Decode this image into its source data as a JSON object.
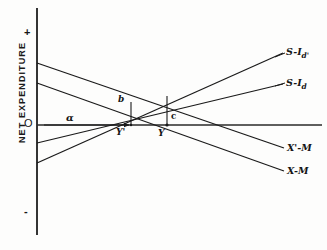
{
  "figure": {
    "axis_title": "NET EXPENDITURE",
    "origin_label": "O",
    "positive_sign": "+",
    "negative_sign": "-",
    "background_color": "#fdfdfc",
    "line_color": "#1a1a1a"
  },
  "curve_labels": {
    "s_i_d_prime": {
      "base": "S-I",
      "sub": "d'"
    },
    "s_i_d": {
      "base": "S-I",
      "sub": "d"
    },
    "x_prime_m": "X'-M",
    "x_m": "X-M"
  },
  "point_labels": {
    "alpha": "α",
    "b": "b",
    "c": "c",
    "y_prime": "Y'",
    "y": "Y"
  },
  "chart_data": {
    "type": "line",
    "title": "",
    "xlabel": "",
    "ylabel": "NET EXPENDITURE",
    "xlim": [
      0,
      327
    ],
    "ylim": [
      -1,
      1
    ],
    "grid": false,
    "legend": "inline-right-end-labels",
    "axes": {
      "vertical_axis_x": 37,
      "vertical_axis_top_y": 8,
      "vertical_axis_bottom_y": 235,
      "horizontal_axis_y": 125,
      "horizontal_axis_x_start": 37,
      "horizontal_axis_x_end": 322
    },
    "series": [
      {
        "name": "S-I d'",
        "slope": "positive",
        "points": [
          [
            37,
            163
          ],
          [
            283,
            53
          ]
        ]
      },
      {
        "name": "S-I d",
        "slope": "positive",
        "points": [
          [
            37,
            143
          ],
          [
            283,
            84
          ]
        ]
      },
      {
        "name": "X'-M",
        "slope": "negative",
        "points": [
          [
            37,
            63
          ],
          [
            284,
            148
          ]
        ]
      },
      {
        "name": "X-M",
        "slope": "negative",
        "points": [
          [
            37,
            83
          ],
          [
            284,
            171
          ]
        ]
      }
    ],
    "annotations": [
      {
        "name": "alpha-arrow",
        "label": "α",
        "type": "horizontal-arrow",
        "from": [
          40,
          125
        ],
        "to": [
          131,
          125
        ]
      },
      {
        "name": "b-segment",
        "label": "b",
        "type": "vertical-segment",
        "from": [
          131,
          103
        ],
        "to": [
          131,
          125
        ]
      },
      {
        "name": "c-segment",
        "label": "c",
        "type": "vertical-segment",
        "from": [
          167,
          98
        ],
        "to": [
          167,
          125
        ]
      },
      {
        "name": "equilibrium-Y-prime",
        "label": "Y'",
        "point": [
          131,
          125
        ]
      },
      {
        "name": "equilibrium-Y",
        "label": "Y",
        "point": [
          167,
          125
        ]
      }
    ]
  }
}
